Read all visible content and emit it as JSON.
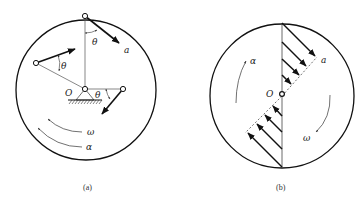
{
  "figure": {
    "panels": [
      {
        "id": "a",
        "caption": "(a)",
        "labels": {
          "pivot": "O",
          "theta_top": "θ",
          "theta_left": "θ",
          "theta_right": "θ",
          "acceleration": "a",
          "angular_velocity": "ω",
          "angular_acceleration": "α"
        }
      },
      {
        "id": "b",
        "caption": "(b)",
        "labels": {
          "pivot": "O",
          "acceleration": "a",
          "angular_velocity": "ω",
          "angular_acceleration": "α"
        }
      }
    ],
    "colors": {
      "stroke": "#111111",
      "thin_stroke": "#444444",
      "background": "#ffffff"
    }
  }
}
